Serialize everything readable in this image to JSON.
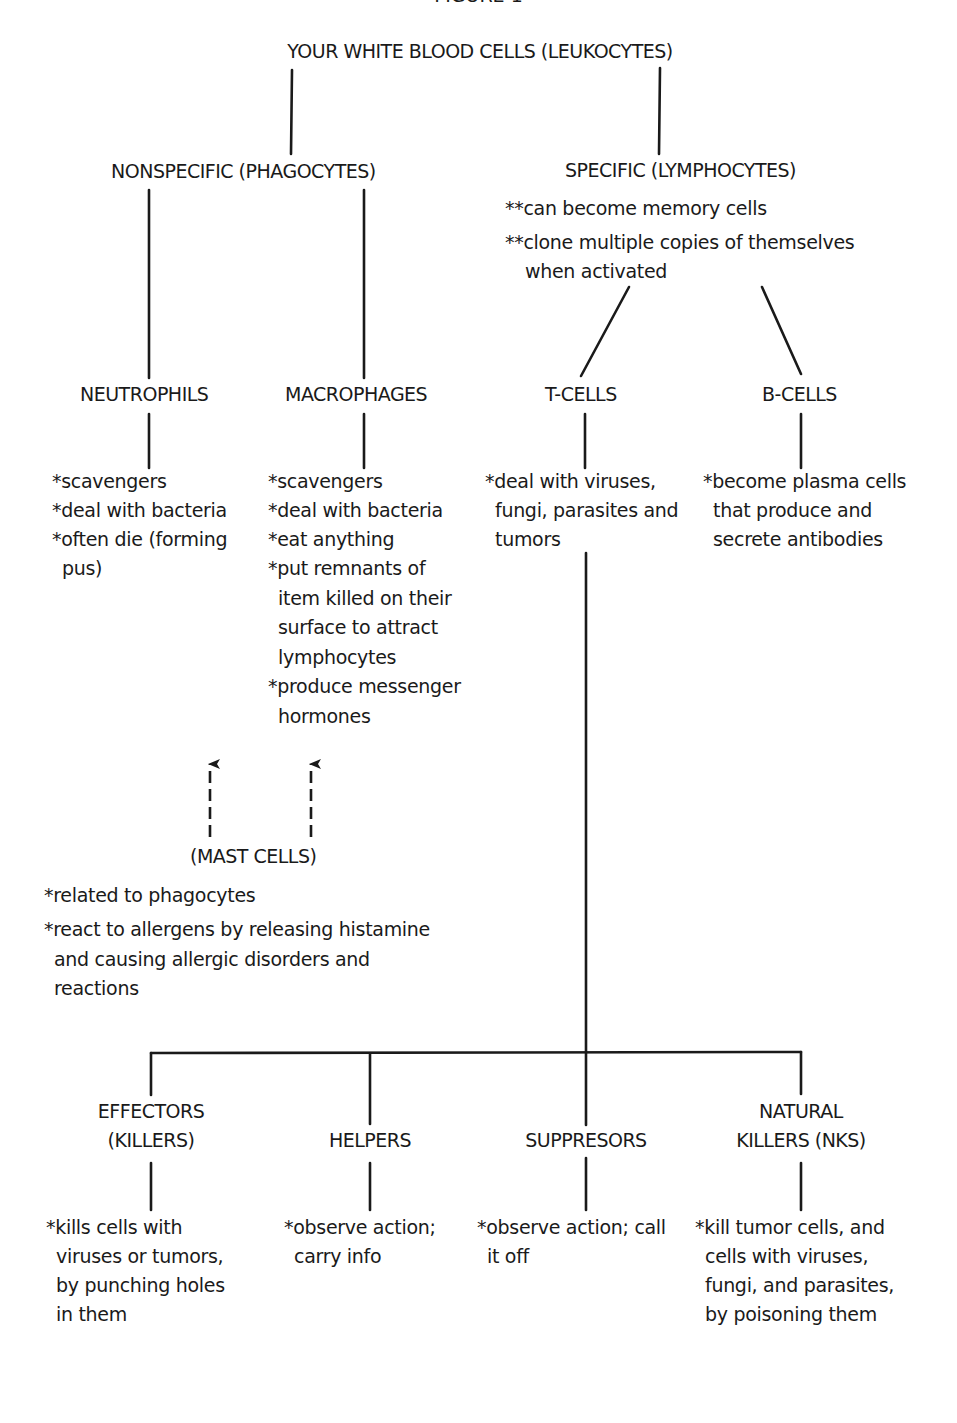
{
  "figure_title": "FIGURE 1",
  "root": {
    "label": "YOUR WHITE BLOOD CELLS (LEUKOCYTES)"
  },
  "nonspecific": {
    "label": "NONSPECIFIC (PHAGOCYTES)"
  },
  "specific": {
    "label": "SPECIFIC (LYMPHOCYTES)",
    "notes": [
      "**can become memory cells",
      "**clone multiple copies of themselves",
      "when activated"
    ]
  },
  "neutrophils": {
    "label": "NEUTROPHILS",
    "notes": [
      "*scavengers",
      "*deal with bacteria",
      "*often die (forming",
      "pus)"
    ]
  },
  "macrophages": {
    "label": "MACROPHAGES",
    "notes": [
      "*scavengers",
      "*deal with bacteria",
      "*eat anything",
      "*put remnants of",
      "item killed on their",
      "surface to attract",
      "lymphocytes",
      "*produce messenger",
      "hormones"
    ]
  },
  "tcells": {
    "label": "T-CELLS",
    "notes": [
      "*deal with viruses,",
      "fungi, parasites and",
      "tumors"
    ]
  },
  "bcells": {
    "label": "B-CELLS",
    "notes": [
      "*become plasma cells",
      "that produce and",
      "secrete antibodies"
    ]
  },
  "mast_cells": {
    "label": "(MAST CELLS)",
    "notes": [
      "*related to phagocytes",
      "*react to allergens by releasing histamine",
      "and causing allergic disorders and",
      "reactions"
    ]
  },
  "effectors": {
    "label_line1": "EFFECTORS",
    "label_line2": "(KILLERS)",
    "notes": [
      "*kills cells with",
      "viruses or tumors,",
      "by punching holes",
      "in them"
    ]
  },
  "helpers": {
    "label": "HELPERS",
    "notes": [
      "*observe action;",
      "carry info"
    ]
  },
  "suppressors": {
    "label": "SUPPRESORS",
    "notes": [
      "*observe action; call",
      "it off"
    ]
  },
  "natural_killers": {
    "label_line1": "NATURAL",
    "label_line2": "KILLERS (NKS)",
    "notes": [
      "*kill tumor cells, and",
      "cells with viruses,",
      "fungi, and parasites,",
      "by poisoning them"
    ]
  },
  "colors": {
    "ink": "#1a1a1a",
    "background": "#ffffff"
  }
}
